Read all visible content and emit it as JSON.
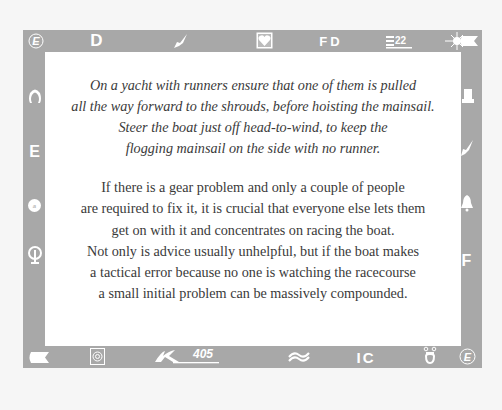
{
  "frame": {
    "colors": {
      "background": "#f6f6f6",
      "frame": "#a8a8a8",
      "panel": "#ffffff",
      "text": "#3a3a3a",
      "icon": "#ffffff"
    },
    "top_icons": [
      {
        "name": "e-circle-icon",
        "label": "E"
      },
      {
        "name": "letter-d-icon",
        "label": "D"
      },
      {
        "name": "bird-icon",
        "label": ""
      },
      {
        "name": "heart-box-icon",
        "label": ""
      },
      {
        "name": "letter-fd-icon",
        "label": "FD"
      },
      {
        "name": "e22-icon",
        "label": "E",
        "sub": "22"
      },
      {
        "name": "star-burst-icon",
        "label": ""
      },
      {
        "name": "flag-pennant-icon",
        "label": ""
      }
    ],
    "left_icons": [
      {
        "name": "omega-arch-icon",
        "label": ""
      },
      {
        "name": "letter-e-icon",
        "label": "E"
      },
      {
        "name": "circle-badge-icon",
        "label": ""
      },
      {
        "name": "anchor-ring-icon",
        "label": ""
      }
    ],
    "right_icons": [
      {
        "name": "hat-icon",
        "label": ""
      },
      {
        "name": "bird-icon",
        "label": ""
      },
      {
        "name": "bell-icon",
        "label": ""
      },
      {
        "name": "letter-f-icon",
        "label": "F"
      }
    ],
    "bottom_icons": [
      {
        "name": "pennant-icon",
        "label": ""
      },
      {
        "name": "spiral-box-icon",
        "label": ""
      },
      {
        "name": "k405-logo-icon",
        "label": "405"
      },
      {
        "name": "wave-icon",
        "label": ""
      },
      {
        "name": "letter-ic-icon",
        "label": "IC"
      },
      {
        "name": "omega-bell-icon",
        "label": ""
      },
      {
        "name": "e-circle-icon",
        "label": "E"
      }
    ]
  },
  "tip": {
    "italic_lines": [
      "On a yacht with runners ensure that one of them is pulled",
      "all the way forward to the shrouds, before hoisting the mainsail.",
      "Steer the boat just off head-to-wind, to keep the",
      "flogging mainsail on the side with no runner."
    ],
    "body_lines": [
      "If there is a gear problem and only a couple of people",
      "are required to fix it, it is crucial that everyone else lets them",
      "get on with it and concentrates on racing the boat.",
      "Not only is advice usually unhelpful, but if the boat makes",
      "a tactical error because no one is watching the racecourse",
      "a small initial problem can be massively compounded."
    ]
  }
}
